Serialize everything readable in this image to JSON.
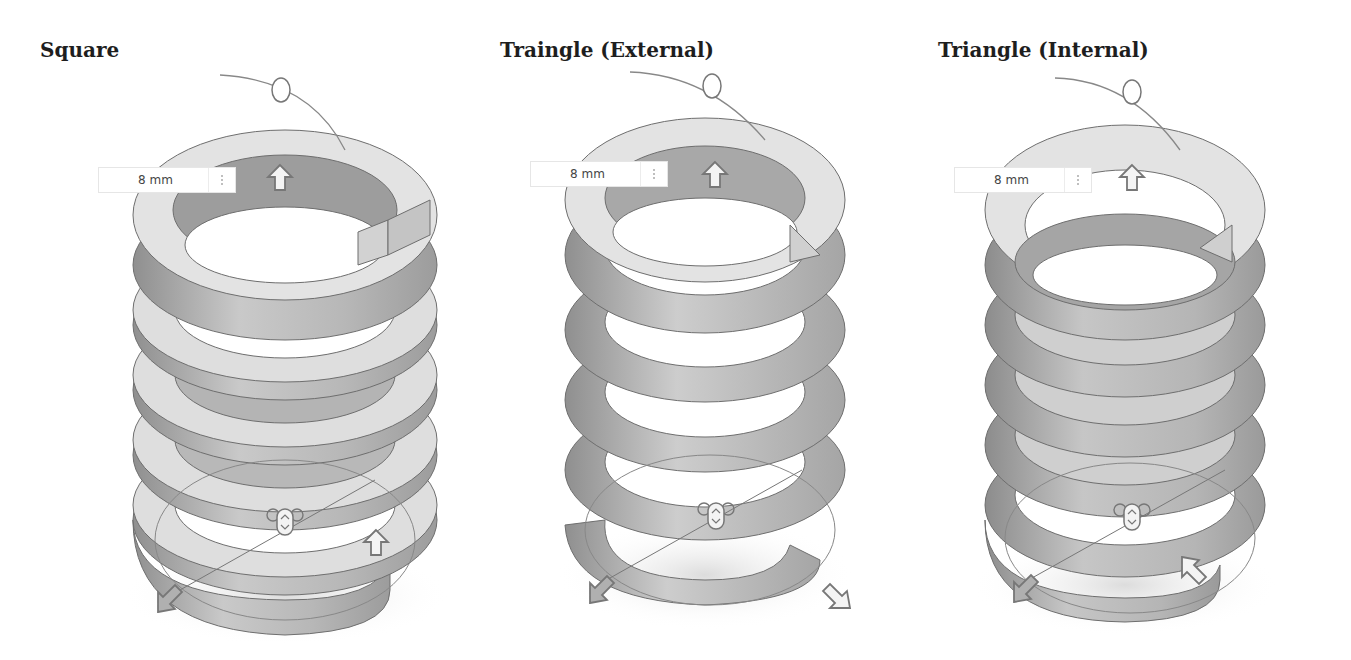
{
  "panels": [
    {
      "title": "Square",
      "profile": "square",
      "dimension_value": "8 mm",
      "title_x": 40,
      "offset_x": 0
    },
    {
      "title": "Traingle (External)",
      "profile": "triangle-external",
      "dimension_value": "8 mm",
      "title_x": 500,
      "offset_x": 430
    },
    {
      "title": "Triangle (Internal)",
      "profile": "triangle-internal",
      "dimension_value": "8 mm",
      "title_x": 938,
      "offset_x": 855
    }
  ],
  "colors": {
    "face_light": "#e2e2e2",
    "face_mid": "#c9c9c9",
    "face_dark": "#9a9a9a",
    "edge": "#6e6e6e",
    "widget": "#8a8a8a",
    "arrow_fill": "#f4f4f4",
    "arrow_dark_fill": "#b0b0b0"
  }
}
